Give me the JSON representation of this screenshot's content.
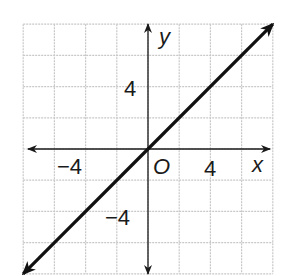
{
  "chart_data": {
    "type": "line",
    "title": "",
    "xlabel": "x",
    "ylabel": "y",
    "origin_label": "O",
    "xlim": [
      -8,
      8
    ],
    "ylim": [
      -8,
      8
    ],
    "grid": true,
    "grid_step": 2,
    "x_tick_labels": [
      {
        "value": -4,
        "label": "−4"
      },
      {
        "value": 4,
        "label": "4"
      }
    ],
    "y_tick_labels": [
      {
        "value": 4,
        "label": "4"
      },
      {
        "value": -4,
        "label": "−4"
      }
    ],
    "series": [
      {
        "name": "y = x",
        "equation": "y = x",
        "slope": 1,
        "intercept": 0,
        "x": [
          -8,
          8
        ],
        "y": [
          -8,
          8
        ],
        "arrows_both_ends": true
      }
    ],
    "colors": {
      "grid": "#c8c8c8",
      "axis": "#1a1a1a",
      "line": "#111111"
    }
  }
}
